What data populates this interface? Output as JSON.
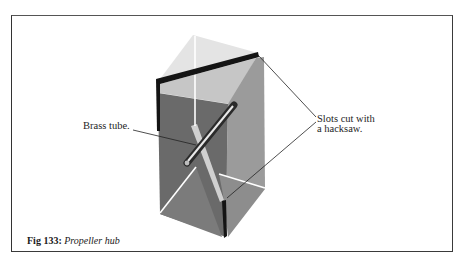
{
  "figure": {
    "number_label": "Fig 133:",
    "title": "Propeller hub"
  },
  "annotations": {
    "brass_tube": "Brass tube.",
    "slots_line1": "Slots cut with",
    "slots_line2": "a hacksaw."
  },
  "colors": {
    "frame": "#3a3a3a",
    "left_face": "#6a6a6a",
    "left_face_lower": "#7b7b7b",
    "right_face": "#9b9b9b",
    "right_face_lower": "#8d8d8d",
    "top_face": "#c6c6c6",
    "ghost_face": "#e4e4e4",
    "slot": "#141414",
    "strip": "#d0d0d0"
  }
}
